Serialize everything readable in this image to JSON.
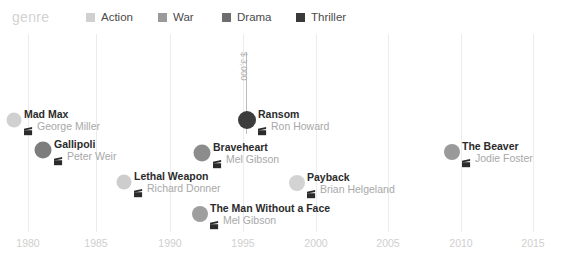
{
  "legend": {
    "title": "genre",
    "items": [
      {
        "label": "Action",
        "color": "#d0d0d0",
        "x": 86
      },
      {
        "label": "War",
        "color": "#9a9a9a",
        "x": 158
      },
      {
        "label": "Drama",
        "color": "#6e6e6e",
        "x": 222
      },
      {
        "label": "Thriller",
        "color": "#3a3a3a",
        "x": 296
      }
    ]
  },
  "axis": {
    "ticks": [
      "1980",
      "1985",
      "1990",
      "1995",
      "2000",
      "2005",
      "2010",
      "2015"
    ],
    "tick_x": [
      28,
      96,
      170,
      243,
      316,
      388,
      461,
      533
    ]
  },
  "annotation": {
    "text": "$ 3,000",
    "line_x": 246,
    "line_top": 18,
    "line_height": 82,
    "text_x": 249,
    "text_y": 18
  },
  "chart_data": {
    "type": "scatter",
    "title": "genre",
    "xlabel": "",
    "ylabel": "",
    "xlim": [
      1978,
      2017
    ],
    "grid": true,
    "legend_position": "top",
    "legend_entries": [
      "Action",
      "War",
      "Drama",
      "Thriller"
    ],
    "annotations": [
      {
        "text": "$ 3,000",
        "target": "Ransom"
      }
    ],
    "points": [
      {
        "title": "Mad Max",
        "director": "George Miller",
        "year": 1979,
        "genre": "Action",
        "color": "#d0d0d0",
        "size": 15,
        "px": 14,
        "py": 86,
        "label_x": 24,
        "label_y": 86
      },
      {
        "title": "Gallipoli",
        "director": "Peter Weir",
        "year": 1981,
        "genre": "War",
        "color": "#7d7d7d",
        "size": 17,
        "px": 43,
        "py": 116,
        "label_x": 54,
        "label_y": 116
      },
      {
        "title": "Lethal Weapon",
        "director": "Richard Donner",
        "year": 1987,
        "genre": "Action",
        "color": "#cdcdcd",
        "size": 15,
        "px": 124,
        "py": 148,
        "label_x": 134,
        "label_y": 148
      },
      {
        "title": "The Man Without a Face",
        "director": "Mel Gibson",
        "year": 1993,
        "genre": "Drama",
        "color": "#9e9e9e",
        "size": 16,
        "px": 200,
        "py": 180,
        "label_x": 210,
        "label_y": 180
      },
      {
        "title": "Braveheart",
        "director": "Mel Gibson",
        "year": 1995,
        "genre": "War",
        "color": "#8c8c8c",
        "size": 17,
        "px": 202,
        "py": 119,
        "label_x": 213,
        "label_y": 119
      },
      {
        "title": "Ransom",
        "director": "Ron Howard",
        "year": 1996,
        "genre": "Thriller",
        "color": "#3d3d3d",
        "size": 18,
        "px": 247,
        "py": 86,
        "label_x": 258,
        "label_y": 86
      },
      {
        "title": "Payback",
        "director": "Brian Helgeland",
        "year": 1999,
        "genre": "Action",
        "color": "#d3d3d3",
        "size": 16,
        "px": 297,
        "py": 149,
        "label_x": 307,
        "label_y": 149
      },
      {
        "title": "The Beaver",
        "director": "Jodie Foster",
        "year": 2011,
        "genre": "Drama",
        "color": "#9a9a9a",
        "size": 16,
        "px": 452,
        "py": 118,
        "label_x": 462,
        "label_y": 118
      }
    ]
  }
}
